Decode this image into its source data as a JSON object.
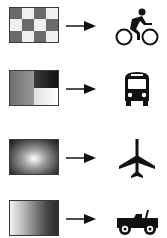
{
  "diagram": {
    "rows": [
      {
        "pattern": "checkerboard",
        "arrow": "right-arrow",
        "icon": "bicycle-icon",
        "label": "bicycle"
      },
      {
        "pattern": "two-region-gradient",
        "arrow": "right-arrow",
        "icon": "bus-icon",
        "label": "bus"
      },
      {
        "pattern": "radial-gradient",
        "arrow": "right-arrow",
        "icon": "airplane-icon",
        "label": "airplane"
      },
      {
        "pattern": "linear-gradient",
        "arrow": "right-arrow",
        "icon": "jeep-icon",
        "label": "jeep"
      }
    ],
    "colors": {
      "dark": "#6a6a6a",
      "light": "#eeeeee",
      "border": "#3a3a3a",
      "icon": "#111111"
    }
  }
}
